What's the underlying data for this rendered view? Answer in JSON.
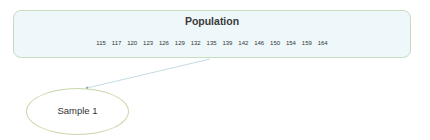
{
  "population": {
    "title": "Population",
    "values": [
      "115",
      "117",
      "120",
      "123",
      "126",
      "129",
      "132",
      "135",
      "139",
      "142",
      "146",
      "150",
      "154",
      "159",
      "164"
    ]
  },
  "sample": {
    "label": "Sample 1"
  },
  "colors": {
    "box_fill": "#eef7fa",
    "box_border": "#c9dcc0",
    "ellipse_border": "#c8d8a8",
    "connector": "#c5dbe6"
  }
}
